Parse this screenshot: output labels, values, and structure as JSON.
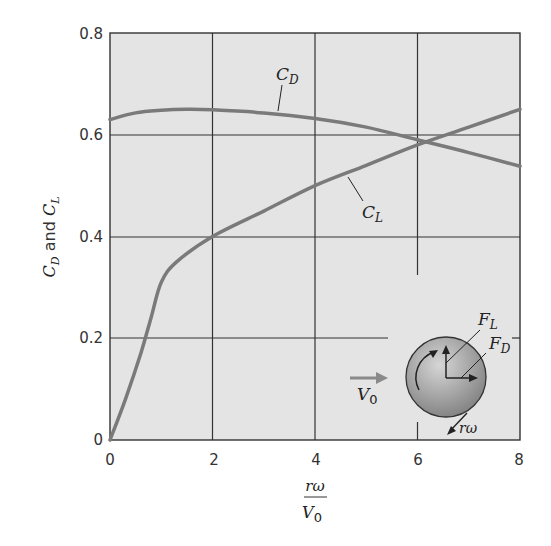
{
  "chart_data": {
    "type": "line",
    "title": "",
    "xlabel": "rω / V0",
    "xlabel_numerator": "rω",
    "xlabel_denominator": "V",
    "xlabel_denominator_sub": "0",
    "ylabel": "C_D and C_L",
    "ylabel_parts": {
      "c1": "C",
      "s1": "D",
      "and": " and ",
      "c2": "C",
      "s2": "L"
    },
    "xlim": [
      0,
      8
    ],
    "ylim": [
      0,
      0.8
    ],
    "x_ticks": [
      "0",
      "2",
      "4",
      "6",
      "8"
    ],
    "y_ticks": [
      "0",
      "0.2",
      "0.4",
      "0.6",
      "0.8"
    ],
    "grid": true,
    "series": [
      {
        "name": "C_D",
        "label_main": "C",
        "label_sub": "D",
        "x": [
          0,
          0.5,
          1,
          1.5,
          2,
          3,
          4,
          5,
          6,
          7,
          8
        ],
        "values": [
          0.63,
          0.643,
          0.648,
          0.65,
          0.649,
          0.643,
          0.632,
          0.615,
          0.59,
          0.565,
          0.538
        ]
      },
      {
        "name": "C_L",
        "label_main": "C",
        "label_sub": "L",
        "x": [
          0,
          0.3,
          0.6,
          0.8,
          1,
          1.3,
          2,
          3,
          4,
          5,
          6,
          7,
          8
        ],
        "values": [
          0,
          0.08,
          0.17,
          0.24,
          0.31,
          0.35,
          0.4,
          0.45,
          0.5,
          0.54,
          0.58,
          0.615,
          0.65
        ]
      }
    ],
    "inset": {
      "description": "Rotating sphere in flow",
      "v0_main": "V",
      "v0_sub": "0",
      "fl_main": "F",
      "fl_sub": "L",
      "fd_main": "F",
      "fd_sub": "D",
      "rw_label": "rω"
    },
    "colors": {
      "plot_bg": "#e4e4e4",
      "curve": "#7a7a7a",
      "grid": "#333333",
      "sphere_light": "#c8c8c8",
      "sphere_dark": "#858585"
    }
  }
}
